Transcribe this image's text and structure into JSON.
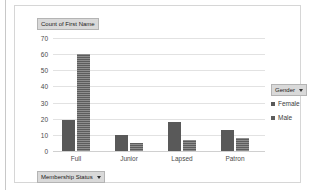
{
  "chart_data": {
    "type": "bar",
    "title": "Count of First Name",
    "xlabel": "Membership Status",
    "ylabel": "",
    "categories": [
      "Full",
      "Junior",
      "Lapsed",
      "Patron"
    ],
    "series": [
      {
        "name": "Female",
        "values": [
          19,
          10,
          18,
          13
        ],
        "color": "#595959"
      },
      {
        "name": "Male",
        "values": [
          60,
          5,
          7,
          8
        ],
        "color": "#5d5d5d"
      }
    ],
    "ylim": [
      0,
      70
    ],
    "y_ticks": [
      0,
      10,
      20,
      30,
      40,
      50,
      60,
      70
    ],
    "y_tick_labels": [
      "0",
      "10",
      "20",
      "30",
      "40",
      "50",
      "60",
      "70"
    ],
    "grid": true,
    "legend_position": "right",
    "legend_title": "Gender"
  },
  "value_field_button": {
    "label": "Count of First Name",
    "has_arrow": false
  },
  "category_field_button": {
    "label": "Membership Status",
    "arrow_icon": "chevron-down-icon"
  },
  "legend_field_button": {
    "label": "Gender",
    "arrow_icon": "chevron-down-icon"
  }
}
